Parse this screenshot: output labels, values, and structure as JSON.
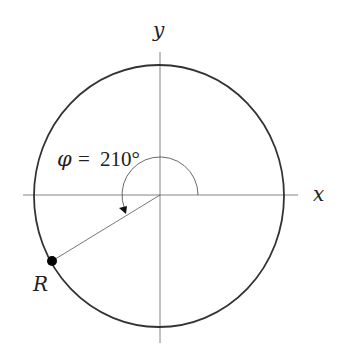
{
  "diagram": {
    "type": "unit-circle-angle",
    "axes": {
      "x_label": "x",
      "y_label": "y"
    },
    "angle": {
      "symbol": "φ",
      "equals": "=",
      "value": "210°",
      "degrees": 210
    },
    "point": {
      "label": "R"
    },
    "colors": {
      "circle": "#333333",
      "axis": "#555555",
      "point": "#000000"
    }
  }
}
